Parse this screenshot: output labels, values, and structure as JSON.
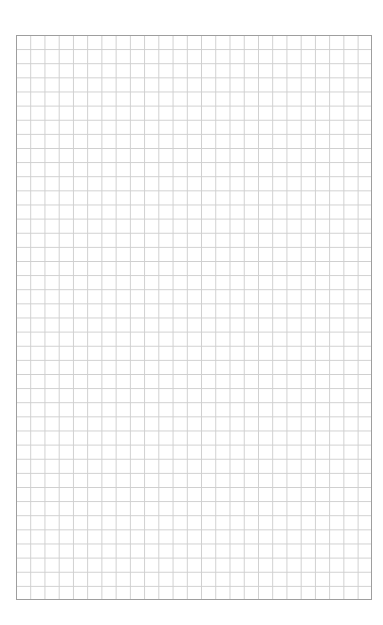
{
  "page": {
    "type": "grid-paper",
    "grid": {
      "columns": 25,
      "rows": 40,
      "line_color": "#cfcfcf",
      "border_color": "#9e9e9e",
      "background": "#ffffff"
    }
  }
}
